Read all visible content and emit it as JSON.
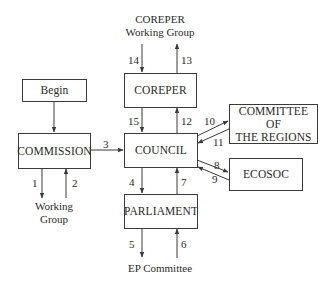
{
  "diagram": {
    "type": "flowchart",
    "nodes": {
      "begin": "Begin",
      "commission": "COMMISSION",
      "coreper": "COREPER",
      "council": "COUNCIL",
      "parliament": "PARLIAMENT",
      "committee_regions_line1": "COMMITTEE OF",
      "committee_regions_line2": "THE REGIONS",
      "ecosoc": "ECOSOC"
    },
    "external": {
      "commission_wg_line1": "Working",
      "commission_wg_line2": "Group",
      "coreper_wg_line1": "COREPER",
      "coreper_wg_line2": "Working Group",
      "ep_committee": "EP Committee"
    },
    "edges": [
      {
        "label": "1",
        "from": "COMMISSION",
        "to": "Working Group"
      },
      {
        "label": "2",
        "from": "Working Group",
        "to": "COMMISSION"
      },
      {
        "label": "3",
        "from": "COMMISSION",
        "to": "COUNCIL"
      },
      {
        "label": "4",
        "from": "COUNCIL",
        "to": "PARLIAMENT"
      },
      {
        "label": "5",
        "from": "PARLIAMENT",
        "to": "EP Committee"
      },
      {
        "label": "6",
        "from": "EP Committee",
        "to": "PARLIAMENT"
      },
      {
        "label": "7",
        "from": "PARLIAMENT",
        "to": "COUNCIL"
      },
      {
        "label": "8",
        "from": "COUNCIL",
        "to": "ECOSOC"
      },
      {
        "label": "9",
        "from": "ECOSOC",
        "to": "COUNCIL"
      },
      {
        "label": "10",
        "from": "COUNCIL",
        "to": "COMMITTEE OF THE REGIONS"
      },
      {
        "label": "11",
        "from": "COMMITTEE OF THE REGIONS",
        "to": "COUNCIL"
      },
      {
        "label": "12",
        "from": "COUNCIL",
        "to": "COREPER"
      },
      {
        "label": "13",
        "from": "COREPER",
        "to": "COREPER Working Group"
      },
      {
        "label": "14",
        "from": "COREPER Working Group",
        "to": "COREPER"
      },
      {
        "label": "15",
        "from": "COREPER",
        "to": "COUNCIL"
      }
    ],
    "line_color": "#3a3a3a",
    "text_color": "#2a2a2a",
    "background": "#ffffff"
  }
}
